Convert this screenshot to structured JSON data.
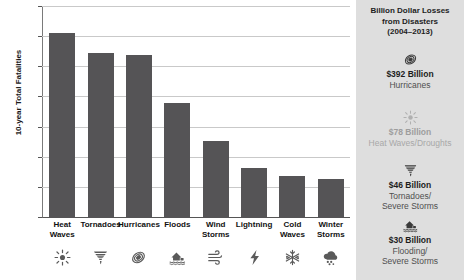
{
  "chart_data": {
    "type": "bar",
    "title": "",
    "xlabel": "",
    "ylabel": "10-year Total Fatalities",
    "ylim": [
      0,
      1400
    ],
    "yticks": [
      0,
      200,
      400,
      600,
      800,
      1000,
      1200,
      1400
    ],
    "grid": true,
    "legend": "none",
    "bar_color": "#555456",
    "categories": [
      "Heat\nWaves",
      "Tornadoes",
      "Hurricanes",
      "Floods",
      "Wind\nStorms",
      "Lightning",
      "Cold\nWaves",
      "Winter\nStorms"
    ],
    "values": [
      1230,
      1095,
      1080,
      760,
      510,
      330,
      280,
      260
    ],
    "category_icons": [
      "sun-icon",
      "tornado-icon",
      "hurricane-icon",
      "flood-house-icon",
      "wind-icon",
      "lightning-icon",
      "snowflake-icon",
      "snow-cloud-icon"
    ]
  },
  "chart": {
    "y_axis_title": "10-year Total Fatalities",
    "y_tick_labels": [
      "1400",
      "1200",
      "1000",
      "800",
      "600",
      "400",
      "200",
      "0"
    ],
    "x_labels": [
      {
        "line1": "Heat",
        "line2": "Waves"
      },
      {
        "line1": "Tornadoes",
        "line2": ""
      },
      {
        "line1": "Hurricanes",
        "line2": ""
      },
      {
        "line1": "Floods",
        "line2": ""
      },
      {
        "line1": "Wind",
        "line2": "Storms"
      },
      {
        "line1": "Lightning",
        "line2": ""
      },
      {
        "line1": "Cold",
        "line2": "Waves"
      },
      {
        "line1": "Winter",
        "line2": "Storms"
      }
    ]
  },
  "sidebar": {
    "title_line1": "Billion Dollar Losses",
    "title_line2": "from Disasters",
    "title_line3": "(2004–2013)",
    "entries": [
      {
        "icon": "hurricane-icon",
        "amount": "$392 Billion",
        "category_line1": "Hurricanes",
        "category_line2": "",
        "faded": false
      },
      {
        "icon": "sun-icon",
        "amount": "$78 Billion",
        "category_line1": "Heat Waves/Droughts",
        "category_line2": "",
        "faded": true
      },
      {
        "icon": "tornado-icon",
        "amount": "$46 Billion",
        "category_line1": "Tornadoes/",
        "category_line2": "Severe Storms",
        "faded": false
      },
      {
        "icon": "flood-house-icon",
        "amount": "$30 Billion",
        "category_line1": "Flooding/",
        "category_line2": "Severe Storms",
        "faded": false
      }
    ]
  },
  "colors": {
    "bar": "#555456",
    "sidebar_bg": "#dedede",
    "grid": "#c9c9c9",
    "text": "#1d1d1d"
  }
}
